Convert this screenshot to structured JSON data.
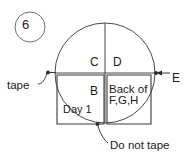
{
  "figure": {
    "item_number": "6",
    "labels": {
      "quadrant_upper_left": "C",
      "quadrant_upper_right": "D",
      "quadrant_lower_left": "B",
      "quadrant_lower_left_sub": "Day 1",
      "quadrant_lower_right_line1": "Back of",
      "quadrant_lower_right_line2": "F,G,H",
      "left_callout": "tape",
      "right_callout": "E",
      "bottom_callout": "Do not tape"
    },
    "colors": {
      "stroke": "#3a3a3a",
      "text": "#1b1b1b",
      "background": "#ffffff"
    },
    "geometry": {
      "circle_center_x": 105,
      "circle_center_y": 73,
      "circle_radius": 50
    }
  }
}
